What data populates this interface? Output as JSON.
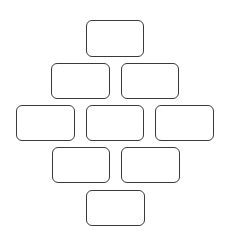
{
  "diagram": {
    "type": "diamond-box-layout",
    "stroke_color": "#3a3a3a",
    "background": "#ffffff",
    "rows": [
      {
        "boxes": [
          {
            "label": "",
            "x": 86,
            "y": 20,
            "w": 58,
            "h": 37
          }
        ]
      },
      {
        "boxes": [
          {
            "label": "",
            "x": 51,
            "y": 63,
            "w": 59,
            "h": 36
          },
          {
            "label": "",
            "x": 121,
            "y": 63,
            "w": 58,
            "h": 36
          }
        ]
      },
      {
        "boxes": [
          {
            "label": "",
            "x": 16,
            "y": 105,
            "w": 59,
            "h": 36
          },
          {
            "label": "",
            "x": 86,
            "y": 105,
            "w": 58,
            "h": 36
          },
          {
            "label": "",
            "x": 155,
            "y": 105,
            "w": 59,
            "h": 36
          }
        ]
      },
      {
        "boxes": [
          {
            "label": "",
            "x": 52,
            "y": 147,
            "w": 58,
            "h": 36
          },
          {
            "label": "",
            "x": 121,
            "y": 147,
            "w": 59,
            "h": 36
          }
        ]
      },
      {
        "boxes": [
          {
            "label": "",
            "x": 86,
            "y": 190,
            "w": 59,
            "h": 36
          }
        ]
      }
    ]
  }
}
